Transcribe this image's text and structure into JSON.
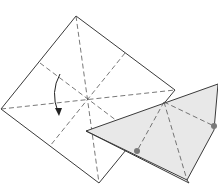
{
  "diagram": {
    "type": "origami-folding-step",
    "colors": {
      "paper_white": "#ffffff",
      "paper_colored": "#e8e8e8",
      "line": "#3a3a3a",
      "dot": "#7a7a7a"
    },
    "elements": [
      {
        "name": "unfolded-square",
        "crease_pattern": "diagonals-and-midlines"
      },
      {
        "name": "fold-arrow",
        "direction": "down"
      },
      {
        "name": "folded-triangle",
        "reference_dots": 2
      }
    ]
  }
}
